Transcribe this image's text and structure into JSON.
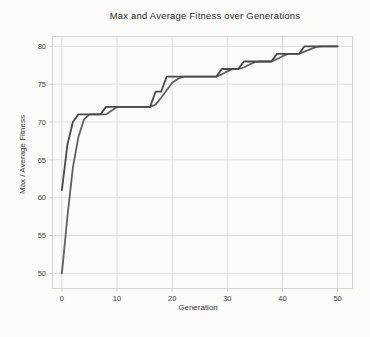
{
  "figure": {
    "title": "Max and Average Fitness over Generations",
    "xlabel": "Generation",
    "ylabel": "Max / Average Fitness"
  },
  "colors": {
    "background": "#fbfbf9",
    "frame": "#d5d5d1",
    "grid": "#dfdeda",
    "tick": "#c8c8c4",
    "tick_text": "#3d3d3d",
    "max_line": "#4a4a4a",
    "avg_line": "#616161"
  },
  "chart_data": {
    "type": "line",
    "title": "Max and Average Fitness over Generations",
    "xlabel": "Generation",
    "ylabel": "Max / Average Fitness",
    "grid": true,
    "legend": "none",
    "xlim": [
      -1.7,
      52.7
    ],
    "ylim": [
      48,
      81.3
    ],
    "xticks": [
      0,
      10,
      20,
      30,
      40,
      50
    ],
    "yticks": [
      50,
      55,
      60,
      65,
      70,
      75,
      80
    ],
    "x": [
      0,
      1,
      2,
      3,
      4,
      5,
      6,
      7,
      8,
      9,
      10,
      11,
      12,
      13,
      14,
      15,
      16,
      17,
      18,
      19,
      20,
      21,
      22,
      23,
      24,
      25,
      26,
      27,
      28,
      29,
      30,
      31,
      32,
      33,
      34,
      35,
      36,
      37,
      38,
      39,
      40,
      41,
      42,
      43,
      44,
      45,
      46,
      47,
      48,
      49,
      50
    ],
    "series": [
      {
        "name": "Average Fitness",
        "color": "#616161",
        "values": [
          50,
          57.5,
          64,
          68,
          70.3,
          71,
          71,
          71,
          71,
          71.5,
          72,
          72,
          72,
          72,
          72,
          72,
          72,
          72.3,
          73.2,
          74.2,
          75.2,
          75.7,
          76,
          76,
          76,
          76,
          76,
          76,
          76,
          76.3,
          76.7,
          77,
          77,
          77.2,
          77.6,
          77.9,
          78,
          78,
          78,
          78.3,
          78.7,
          79,
          79,
          79,
          79.3,
          79.6,
          79.9,
          80,
          80,
          80,
          80
        ]
      },
      {
        "name": "Max Fitness",
        "color": "#4a4a4a",
        "values": [
          61,
          67,
          70,
          71,
          71,
          71,
          71,
          71,
          72,
          72,
          72,
          72,
          72,
          72,
          72,
          72,
          72,
          74,
          74,
          76,
          76,
          76,
          76,
          76,
          76,
          76,
          76,
          76,
          76,
          77,
          77,
          77,
          77,
          78,
          78,
          78,
          78,
          78,
          78,
          79,
          79,
          79,
          79,
          79,
          80,
          80,
          80,
          80,
          80,
          80,
          80
        ]
      }
    ]
  }
}
